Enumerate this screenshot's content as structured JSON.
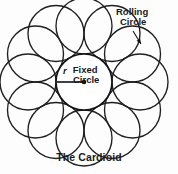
{
  "figure": {
    "caption": "The Cardioid",
    "background_color": "#fdfdfd",
    "stroke_color": "#1f1f1f",
    "text_color": "#1a1a1a",
    "annotations": {
      "rolling": {
        "line1": "Rolling",
        "line2": "Circle"
      },
      "fixed": {
        "line1": "Fixed",
        "line2": "Circle"
      },
      "radius_symbol": "r"
    }
  },
  "chart_data": {
    "type": "diagram",
    "title": "The Cardioid",
    "fixed_circle": {
      "label": "Fixed Circle",
      "center_x": 84,
      "center_y": 82,
      "radius": 28,
      "radius_label": "r"
    },
    "rolling_circle": {
      "label": "Rolling Circle",
      "radius": 28,
      "count": 12,
      "orbit_radius": 56,
      "start_angle_deg": -90,
      "centers_deg": [
        -90,
        -60,
        -30,
        0,
        30,
        60,
        90,
        120,
        150,
        180,
        210,
        240
      ]
    },
    "leader_line": {
      "from_x": 133,
      "from_y": 31,
      "to_x": 141,
      "to_y": 44,
      "arrow": true
    },
    "radius_line": {
      "from_x": 57,
      "from_y": 82,
      "to_x": 84,
      "to_y": 82,
      "dot_radius": 2.3
    },
    "xlim": [
      0,
      178
    ],
    "ylim": [
      0,
      174
    ],
    "grid": false,
    "legend": "none"
  }
}
